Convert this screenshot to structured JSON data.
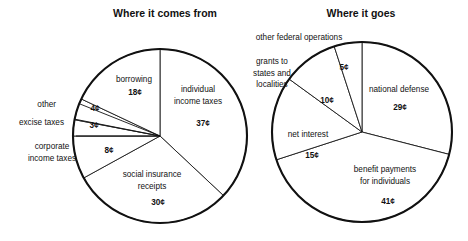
{
  "figure": {
    "background": "#ffffff",
    "ink": "#111111"
  },
  "charts": [
    {
      "id": "where-it-comes-from",
      "title": "Where it comes from",
      "center": {
        "x": 160,
        "y": 136
      },
      "radius": 87,
      "title_pos": {
        "x": 165,
        "y": 17
      },
      "slices": [
        {
          "name": "individual-income-taxes",
          "label_lines": [
            "individual",
            "income taxes"
          ],
          "value": "37¢",
          "start": 0,
          "end": 133.2,
          "label_pos": {
            "x": 198,
            "y": 92
          },
          "value_pos": {
            "x": 203,
            "y": 126
          },
          "external": false
        },
        {
          "name": "social-insurance-receipts",
          "label_lines": [
            "social insurance",
            "receipts"
          ],
          "value": "30¢",
          "start": 133.2,
          "end": 241.2,
          "label_pos": {
            "x": 152,
            "y": 177
          },
          "value_pos": {
            "x": 158,
            "y": 205
          },
          "external": false
        },
        {
          "name": "corporate-income-taxes",
          "label_lines": [
            "corporate",
            "income taxes"
          ],
          "value": "8¢",
          "start": 241.2,
          "end": 270.0,
          "label_pos": {
            "x": 52,
            "y": 149
          },
          "value_pos": {
            "x": 109,
            "y": 153
          },
          "external": true,
          "ext_anchor": "middle",
          "leader": {
            "x1": 76,
            "y1": 136,
            "x2": 160,
            "y2": 136
          }
        },
        {
          "name": "excise-taxes",
          "label_lines": [
            "excise taxes"
          ],
          "value": "3¢",
          "start": 270.0,
          "end": 280.8,
          "label_pos": {
            "x": 64,
            "y": 125
          },
          "value_pos": {
            "x": 94,
            "y": 128
          },
          "external": true,
          "ext_anchor": "end",
          "leader": {
            "x1": 74,
            "y1": 119,
            "x2": 160,
            "y2": 136
          }
        },
        {
          "name": "other",
          "label_lines": [
            "other"
          ],
          "value": "4¢",
          "start": 280.8,
          "end": 295.2,
          "label_pos": {
            "x": 56,
            "y": 107
          },
          "value_pos": {
            "x": 95,
            "y": 111
          },
          "external": true,
          "ext_anchor": "end",
          "leader": {
            "x1": 80,
            "y1": 104,
            "x2": 160,
            "y2": 136
          }
        },
        {
          "name": "borrowing",
          "label_lines": [
            "borrowing"
          ],
          "value": "18¢",
          "start": 295.2,
          "end": 360.0,
          "label_pos": {
            "x": 134,
            "y": 82
          },
          "value_pos": {
            "x": 135,
            "y": 95
          },
          "external": false
        }
      ]
    },
    {
      "id": "where-it-goes",
      "title": "Where it goes",
      "center": {
        "x": 362,
        "y": 132
      },
      "radius": 90,
      "title_pos": {
        "x": 361,
        "y": 17
      },
      "slices": [
        {
          "name": "national-defense",
          "label_lines": [
            "national defense"
          ],
          "value": "29¢",
          "start": 0,
          "end": 104.4,
          "label_pos": {
            "x": 399,
            "y": 92
          },
          "value_pos": {
            "x": 400,
            "y": 110
          },
          "external": false
        },
        {
          "name": "benefit-payments-for-individuals",
          "label_lines": [
            "benefit payments",
            "for individuals"
          ],
          "value": "41¢",
          "start": 104.4,
          "end": 252.0,
          "label_pos": {
            "x": 385,
            "y": 172
          },
          "value_pos": {
            "x": 388,
            "y": 204
          },
          "external": false
        },
        {
          "name": "net-interest",
          "label_lines": [
            "net interest"
          ],
          "value": "15¢",
          "start": 252.0,
          "end": 306.0,
          "label_pos": {
            "x": 308,
            "y": 137
          },
          "value_pos": {
            "x": 312,
            "y": 158
          },
          "external": false
        },
        {
          "name": "grants-to-states-and-localities",
          "label_lines": [
            "grants to",
            "states and",
            "localities"
          ],
          "value": "10¢",
          "start": 306.0,
          "end": 342.0,
          "label_pos": {
            "x": 272,
            "y": 64
          },
          "value_pos": {
            "x": 327,
            "y": 103
          },
          "external": true,
          "ext_anchor": "middle"
        },
        {
          "name": "other-federal-operations",
          "label_lines": [
            "other federal operations"
          ],
          "value": "5¢",
          "start": 342.0,
          "end": 360.0,
          "label_pos": {
            "x": 299,
            "y": 40
          },
          "value_pos": {
            "x": 344,
            "y": 70
          },
          "external": true,
          "ext_anchor": "middle"
        }
      ]
    }
  ]
}
